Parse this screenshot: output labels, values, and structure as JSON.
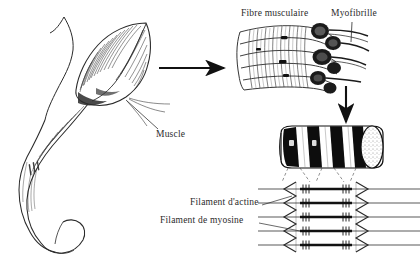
{
  "figure": {
    "kind": "anatomical-illustration",
    "language": "fr",
    "background_color": "#ffffff",
    "ink_color": "#1a1a1a"
  },
  "labels": {
    "muscle": "Muscle",
    "fibre_musculaire": "Fibre musculaire",
    "myofibrille": "Myofibrille",
    "filament_actine": "Filament d'actine",
    "filament_myosine": "Filament de myosine"
  },
  "panels": {
    "limb": {
      "name": "limb-with-muscle",
      "caption": "Muscle"
    },
    "fiber": {
      "name": "muscle-fiber-bundle",
      "caption": "Fibre musculaire"
    },
    "myofibril": {
      "name": "striated-myofibril-cylinder",
      "caption": "Myofibrille"
    },
    "sarcomere": {
      "name": "sarcomere-filament-array",
      "rows": 5
    }
  },
  "arrows": {
    "horizontal": "arrow-right",
    "vertical": "arrow-down"
  }
}
